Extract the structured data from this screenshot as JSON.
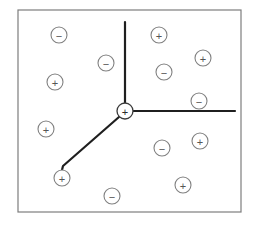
{
  "canvas": {
    "width": 259,
    "height": 229,
    "background": "#ffffff"
  },
  "frame": {
    "label": "diagram-border",
    "x": 18,
    "y": 10,
    "width": 223,
    "height": 202,
    "stroke": "#7d7d7d",
    "stroke_width": 1.2,
    "fill": "#ffffff"
  },
  "junction": {
    "label": "central-node",
    "charge": "+",
    "cx": 125,
    "cy": 111,
    "r": 8,
    "stroke": "#3a3a3a",
    "stroke_width": 1.3,
    "fill": "#ffffff",
    "sign_color": "#2b2b2b"
  },
  "branches": {
    "stroke": "#1f1f1f",
    "stroke_width": 2.2,
    "items": [
      {
        "name": "branch-up",
        "direction": "up",
        "points": "125,103 125,22"
      },
      {
        "name": "branch-right",
        "direction": "right",
        "points": "133,111 235,111"
      },
      {
        "name": "branch-down-left",
        "direction": "down-left",
        "points": "119,117 63,166 62,170"
      }
    ]
  },
  "charges": {
    "radius": 8,
    "stroke": "#808080",
    "stroke_width": 1.1,
    "fill": "#ffffff",
    "sign_color": "#555555",
    "positive_symbol": "+",
    "negative_symbol": "−",
    "items": [
      {
        "name": "charge-minus-1",
        "sign": "-",
        "cx": 59,
        "cy": 35,
        "quadrant": "top-left"
      },
      {
        "name": "charge-minus-2",
        "sign": "-",
        "cx": 106,
        "cy": 63,
        "quadrant": "top-left"
      },
      {
        "name": "charge-plus-1",
        "sign": "+",
        "cx": 55,
        "cy": 82,
        "quadrant": "top-left"
      },
      {
        "name": "charge-plus-2",
        "sign": "+",
        "cx": 159,
        "cy": 35,
        "quadrant": "top-right"
      },
      {
        "name": "charge-plus-3",
        "sign": "+",
        "cx": 203,
        "cy": 58,
        "quadrant": "top-right"
      },
      {
        "name": "charge-minus-3",
        "sign": "-",
        "cx": 164,
        "cy": 72,
        "quadrant": "top-right"
      },
      {
        "name": "charge-minus-4",
        "sign": "-",
        "cx": 199,
        "cy": 101,
        "quadrant": "top-right"
      },
      {
        "name": "charge-plus-4",
        "sign": "+",
        "cx": 46,
        "cy": 129,
        "quadrant": "bottom-left"
      },
      {
        "name": "charge-plus-5",
        "sign": "+",
        "cx": 62,
        "cy": 178,
        "quadrant": "bottom-left"
      },
      {
        "name": "charge-minus-5",
        "sign": "-",
        "cx": 112,
        "cy": 196,
        "quadrant": "bottom-left"
      },
      {
        "name": "charge-minus-6",
        "sign": "-",
        "cx": 162,
        "cy": 148,
        "quadrant": "bottom-right"
      },
      {
        "name": "charge-plus-6",
        "sign": "+",
        "cx": 200,
        "cy": 141,
        "quadrant": "bottom-right"
      },
      {
        "name": "charge-plus-7",
        "sign": "+",
        "cx": 183,
        "cy": 185,
        "quadrant": "bottom-right"
      }
    ]
  }
}
